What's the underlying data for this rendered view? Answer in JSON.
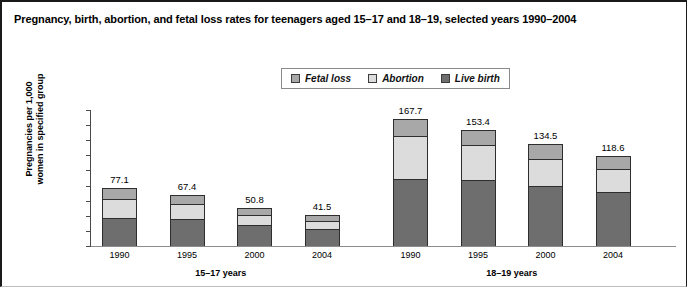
{
  "figure": {
    "title": "Pregnancy, birth, abortion, and fetal loss rates for teenagers aged 15–17 and 18–19, selected years 1990–2004"
  },
  "legend": {
    "items": [
      {
        "label": "Fetal loss",
        "color": "#a8a8a8"
      },
      {
        "label": "Abortion",
        "color": "#dcdcdc"
      },
      {
        "label": "Live birth",
        "color": "#6e6e6e"
      }
    ]
  },
  "axis": {
    "ylabel_line1": "Pregnancies per 1,000",
    "ylabel_line2": "women in specified group",
    "yticks": [
      "180",
      "160",
      "140",
      "120",
      "100",
      "80",
      "60",
      "40",
      "20",
      "0"
    ]
  },
  "chart_data": {
    "type": "bar",
    "subtype": "stacked",
    "title": "Pregnancy, birth, abortion, and fetal loss rates for teenagers aged 15–17 and 18–19, selected years 1990–2004",
    "xlabel": "",
    "ylabel": "Pregnancies per 1,000 women in specified group",
    "ylim": [
      0,
      180
    ],
    "ytick_step": 20,
    "grid": false,
    "legend_position": "top-center",
    "groups": [
      "15–17 years",
      "18–19 years"
    ],
    "categories": [
      "1990",
      "1995",
      "2000",
      "2004",
      "1990",
      "1995",
      "2000",
      "2004"
    ],
    "category_groups": [
      "15–17 years",
      "15–17 years",
      "15–17 years",
      "15–17 years",
      "18–19 years",
      "18–19 years",
      "18–19 years",
      "18–19 years"
    ],
    "series": [
      {
        "name": "Live birth",
        "color": "#6e6e6e",
        "values": [
          37.5,
          36.0,
          27.4,
          22.1,
          88.6,
          87.7,
          79.5,
          72.1
        ]
      },
      {
        "name": "Abortion",
        "color": "#dcdcdc",
        "values": [
          25.0,
          19.5,
          13.4,
          11.4,
          56.6,
          45.6,
          35.3,
          29.9
        ]
      },
      {
        "name": "Fetal loss",
        "color": "#a8a8a8",
        "values": [
          14.6,
          11.9,
          10.0,
          8.0,
          22.5,
          20.1,
          19.7,
          16.6
        ]
      }
    ],
    "totals": [
      77.1,
      67.4,
      50.8,
      41.5,
      167.7,
      153.4,
      134.5,
      118.6
    ],
    "total_labels": [
      "77.1",
      "67.4",
      "50.8",
      "41.5",
      "167.7",
      "153.4",
      "134.5",
      "118.6"
    ]
  }
}
